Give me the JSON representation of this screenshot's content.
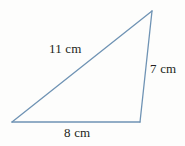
{
  "figure": {
    "kind": "triangle-diagram",
    "background_color": "#fdfdfc",
    "stroke_color": "#6f93b4",
    "label_color": "#231f20",
    "units": "cm",
    "vertices": {
      "apex": {
        "x": 152,
        "y": 11
      },
      "bottom_left": {
        "x": 12,
        "y": 122
      },
      "bottom_right": {
        "x": 140,
        "y": 122
      }
    },
    "sides": [
      {
        "id": "hypotenuse",
        "name": "hypotenuse",
        "label": "11 cm",
        "value": 11,
        "from": "bottom_left",
        "to": "apex"
      },
      {
        "id": "right-side",
        "name": "right-side",
        "label": "7 cm",
        "value": 7,
        "from": "apex",
        "to": "bottom_right"
      },
      {
        "id": "base",
        "name": "base",
        "label": "8 cm",
        "value": 8,
        "from": "bottom_left",
        "to": "bottom_right"
      }
    ]
  }
}
